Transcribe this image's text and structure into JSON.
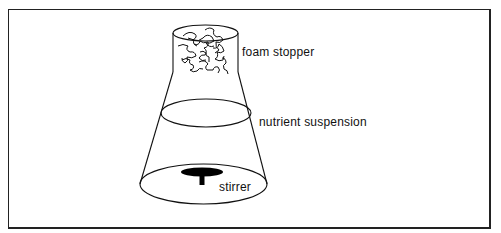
{
  "diagram": {
    "type": "flask-apparatus",
    "labels": {
      "foam_stopper": "foam  stopper",
      "nutrient_suspension": "nutrient  suspension",
      "stirrer": "stirrer"
    },
    "colors": {
      "line": "#111111",
      "background": "#ffffff",
      "frame": "#222222"
    }
  }
}
